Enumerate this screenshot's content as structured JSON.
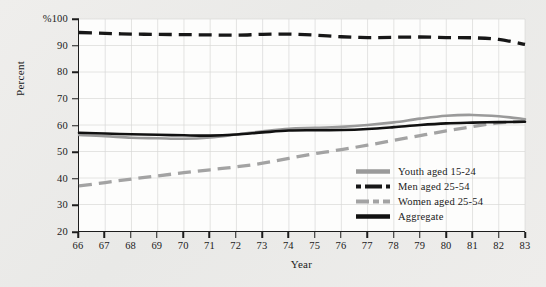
{
  "chart_data": {
    "type": "line",
    "title": "",
    "xlabel": "Year",
    "ylabel": "Percent",
    "y_unit_prefix": "%",
    "xlim": [
      66,
      83
    ],
    "ylim": [
      20,
      100
    ],
    "yticks": [
      20,
      30,
      40,
      50,
      60,
      70,
      80,
      90,
      100
    ],
    "ytick_labels": [
      "20",
      "30",
      "40",
      "50",
      "60",
      "70",
      "80",
      "90",
      "%100"
    ],
    "xticks": [
      66,
      67,
      68,
      69,
      70,
      71,
      72,
      73,
      74,
      75,
      76,
      77,
      78,
      79,
      80,
      81,
      82,
      83
    ],
    "xtick_labels": [
      "66",
      "67",
      "68",
      "69",
      "70",
      "71",
      "72",
      "73",
      "74",
      "75",
      "76",
      "77",
      "78",
      "79",
      "80",
      "81",
      "82",
      "83"
    ],
    "grid": true,
    "legend_position": "lower-right-inside",
    "x": [
      66,
      67,
      68,
      69,
      70,
      71,
      72,
      73,
      74,
      75,
      76,
      77,
      78,
      79,
      80,
      81,
      82,
      83
    ],
    "series": [
      {
        "name": "Youth aged 15-24",
        "color": "#9a9a9a",
        "style": "solid",
        "values": [
          56.2,
          55.8,
          55.2,
          55.0,
          54.8,
          55.3,
          56.4,
          57.6,
          58.6,
          58.9,
          59.3,
          60.0,
          61.0,
          62.4,
          63.5,
          63.8,
          63.3,
          62.2
        ]
      },
      {
        "name": "Men aged 25-54",
        "color": "#171717",
        "style": "dashed",
        "values": [
          94.9,
          94.6,
          94.3,
          94.2,
          94.1,
          94.0,
          93.9,
          94.2,
          94.3,
          93.9,
          93.3,
          93.0,
          93.1,
          93.2,
          93.0,
          92.9,
          92.3,
          90.4
        ]
      },
      {
        "name": "Women aged 25-54",
        "color": "#a3a3a3",
        "style": "dashed",
        "values": [
          37.0,
          38.3,
          39.6,
          40.8,
          42.0,
          43.1,
          44.2,
          45.6,
          47.4,
          49.2,
          50.7,
          52.4,
          54.2,
          56.0,
          57.8,
          59.4,
          60.8,
          61.4
        ]
      },
      {
        "name": "Aggregate",
        "color": "#111111",
        "style": "solid",
        "values": [
          57.1,
          56.8,
          56.5,
          56.3,
          56.1,
          56.0,
          56.4,
          57.2,
          57.9,
          58.0,
          58.1,
          58.5,
          59.2,
          60.0,
          60.6,
          60.9,
          61.1,
          61.2
        ]
      }
    ]
  },
  "axes": {
    "y_title": "Percent",
    "x_title": "Year"
  },
  "legend": {
    "items": [
      {
        "label": "Youth aged 15-24"
      },
      {
        "label": "Men aged 25-54"
      },
      {
        "label": "Women aged 25-54"
      },
      {
        "label": "Aggregate"
      }
    ]
  }
}
